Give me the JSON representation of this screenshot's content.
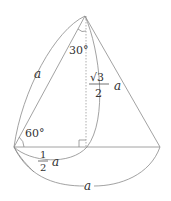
{
  "diagram": {
    "type": "geometry-cone-cross-section",
    "colors": {
      "line": "#8a8a8a",
      "text": "#333333",
      "dashed": "#9a9a9a",
      "background": "#ffffff"
    },
    "labels": {
      "apex_angle": "30°",
      "base_angle": "60°",
      "slant_side": "a",
      "height_num": "√3",
      "height_den": "2",
      "height_var": "a",
      "half_base_num": "1",
      "half_base_den": "2",
      "half_base_var": "a",
      "base": "a"
    },
    "points": {
      "apex": [
        85,
        16
      ],
      "left": [
        14,
        147
      ],
      "right": [
        160,
        147
      ],
      "foot": [
        87,
        147
      ]
    }
  }
}
